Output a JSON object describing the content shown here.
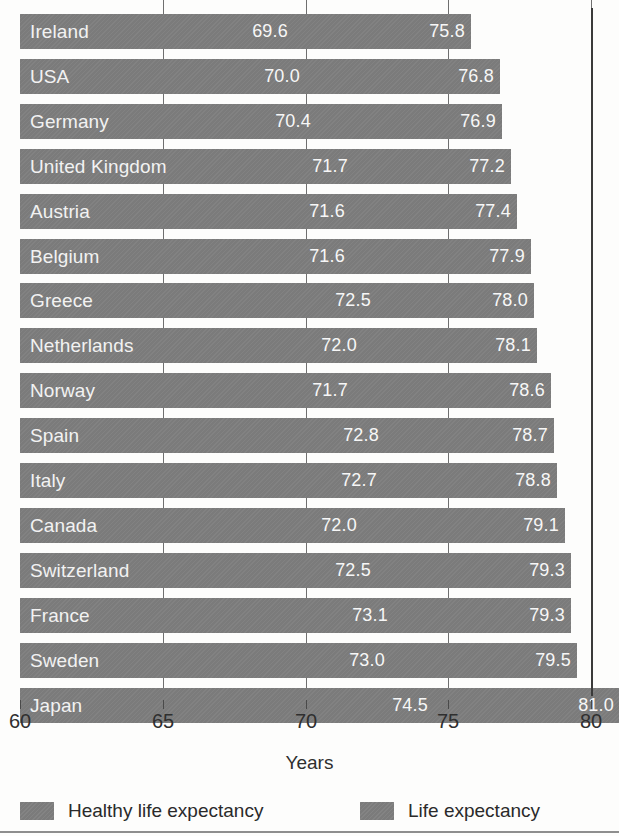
{
  "chart_data": {
    "type": "bar",
    "orientation": "horizontal",
    "title": "",
    "xlabel": "Years",
    "ylabel": "",
    "xlim": [
      60,
      81.5
    ],
    "xticks": [
      60,
      65,
      70,
      75,
      80
    ],
    "xtick_labels": [
      "60",
      "65",
      "70",
      "75",
      "80"
    ],
    "grid": true,
    "legend_position": "bottom",
    "categories": [
      "Ireland",
      "USA",
      "Germany",
      "United Kingdom",
      "Austria",
      "Belgium",
      "Greece",
      "Netherlands",
      "Norway",
      "Spain",
      "Italy",
      "Canada",
      "Switzerland",
      "France",
      "Sweden",
      "Japan"
    ],
    "series": [
      {
        "name": "Healthy life expectancy",
        "color": "#7b7b7b",
        "values": [
          69.6,
          70.0,
          70.4,
          71.7,
          71.6,
          71.6,
          72.5,
          72.0,
          71.7,
          72.8,
          72.7,
          72.0,
          72.5,
          73.1,
          73.0,
          74.5
        ]
      },
      {
        "name": "Life expectancy",
        "color": "#7b7b7b",
        "values": [
          75.8,
          76.8,
          76.9,
          77.2,
          77.4,
          77.9,
          78.0,
          78.1,
          78.6,
          78.7,
          78.8,
          79.1,
          79.3,
          79.3,
          79.5,
          81.0
        ]
      }
    ],
    "rows": [
      {
        "country": "Ireland",
        "healthy": "69.6",
        "life": "75.8"
      },
      {
        "country": "USA",
        "healthy": "70.0",
        "life": "76.8"
      },
      {
        "country": "Germany",
        "healthy": "70.4",
        "life": "76.9"
      },
      {
        "country": "United Kingdom",
        "healthy": "71.7",
        "life": "77.2"
      },
      {
        "country": "Austria",
        "healthy": "71.6",
        "life": "77.4"
      },
      {
        "country": "Belgium",
        "healthy": "71.6",
        "life": "77.9"
      },
      {
        "country": "Greece",
        "healthy": "72.5",
        "life": "78.0"
      },
      {
        "country": "Netherlands",
        "healthy": "72.0",
        "life": "78.1"
      },
      {
        "country": "Norway",
        "healthy": "71.7",
        "life": "78.6"
      },
      {
        "country": "Spain",
        "healthy": "72.8",
        "life": "78.7"
      },
      {
        "country": "Italy",
        "healthy": "72.7",
        "life": "78.8"
      },
      {
        "country": "Canada",
        "healthy": "72.0",
        "life": "79.1"
      },
      {
        "country": "Switzerland",
        "healthy": "72.5",
        "life": "79.3"
      },
      {
        "country": "France",
        "healthy": "73.1",
        "life": "79.3"
      },
      {
        "country": "Sweden",
        "healthy": "73.0",
        "life": "79.5"
      },
      {
        "country": "Japan",
        "healthy": "74.5",
        "life": "81.0"
      }
    ]
  },
  "axis": {
    "xlabel": "Years",
    "ticks": [
      "60",
      "65",
      "70",
      "75",
      "80"
    ]
  },
  "legend": {
    "items": [
      {
        "label": "Healthy life expectancy",
        "color": "#7b7b7b"
      },
      {
        "label": "Life expectancy",
        "color": "#7b7b7b"
      }
    ]
  }
}
